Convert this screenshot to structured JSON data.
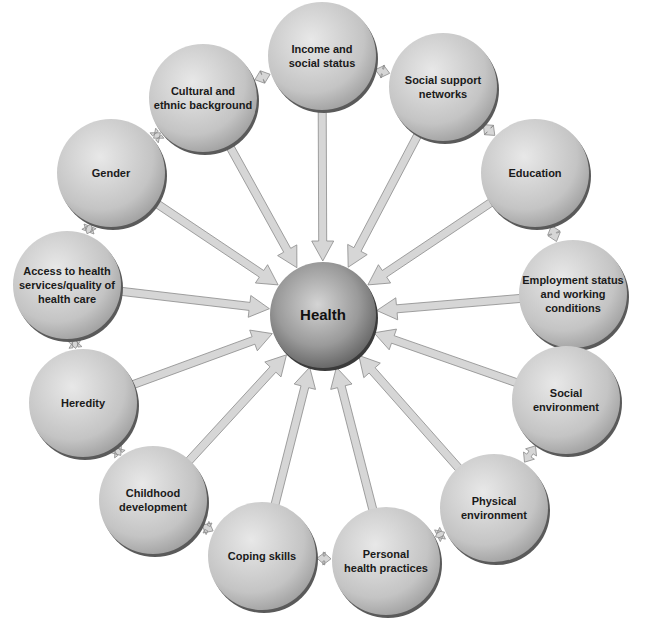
{
  "diagram": {
    "center": {
      "id": "health",
      "label": "Health",
      "cx": 323,
      "cy": 315,
      "r": 53
    },
    "node_radius": 54,
    "colors": {
      "node_fill_light": "#e4e4e4",
      "node_fill_dark": "#a9a9a9",
      "node_shadow": "#5a5a5a",
      "center_fill_light": "#d0d0d0",
      "center_fill_dark": "#6e6e6e",
      "arrow_fill": "#d6d6d6",
      "arrow_stroke": "#8a8a8a",
      "text": "#1a1a1a"
    },
    "nodes": [
      {
        "id": "income",
        "lines": [
          "Income and",
          "social status"
        ],
        "cx": 322,
        "cy": 56
      },
      {
        "id": "social-support",
        "lines": [
          "Social support",
          "networks"
        ],
        "cx": 443,
        "cy": 87
      },
      {
        "id": "education",
        "lines": [
          "Education"
        ],
        "cx": 535,
        "cy": 173
      },
      {
        "id": "employment",
        "lines": [
          "Employment status",
          "and working",
          "conditions"
        ],
        "cx": 573,
        "cy": 294
      },
      {
        "id": "social-environment",
        "lines": [
          "Social",
          "environment"
        ],
        "cx": 566,
        "cy": 400
      },
      {
        "id": "physical-environment",
        "lines": [
          "Physical",
          "environment"
        ],
        "cx": 494,
        "cy": 508
      },
      {
        "id": "personal-health",
        "lines": [
          "Personal",
          "health practices"
        ],
        "cx": 386,
        "cy": 561
      },
      {
        "id": "coping-skills",
        "lines": [
          "Coping skills"
        ],
        "cx": 262,
        "cy": 556
      },
      {
        "id": "childhood",
        "lines": [
          "Childhood",
          "development"
        ],
        "cx": 153,
        "cy": 500
      },
      {
        "id": "heredity",
        "lines": [
          "Heredity"
        ],
        "cx": 83,
        "cy": 403
      },
      {
        "id": "access",
        "lines": [
          "Access to health",
          "services/quality of",
          "health care"
        ],
        "cx": 67,
        "cy": 285
      },
      {
        "id": "gender",
        "lines": [
          "Gender"
        ],
        "cx": 111,
        "cy": 173
      },
      {
        "id": "cultural",
        "lines": [
          "Cultural and",
          "ethnic background"
        ],
        "cx": 203,
        "cy": 98
      }
    ]
  }
}
